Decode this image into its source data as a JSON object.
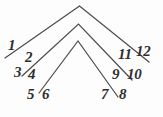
{
  "figure": {
    "background_color": "#fdfdfd",
    "ink_color": "#4a4a4a",
    "label_color": "#2e2e2e",
    "stroke_width": 1.2,
    "canvas": {
      "width": 163,
      "height": 117
    }
  },
  "chart_data": {
    "type": "diagram",
    "subtype": "nested-chevrons",
    "title": "",
    "xlabel": "",
    "ylabel": "",
    "grid": false,
    "legend": null,
    "axis_ranges": {
      "x": [
        0,
        163
      ],
      "y": [
        0,
        117
      ]
    },
    "shapes": [
      {
        "name": "outer-chevron",
        "apex": {
          "x": 79.5,
          "y": 6
        },
        "left_end": {
          "x": 5,
          "y": 58
        },
        "right_end": {
          "x": 149,
          "y": 62
        },
        "points": "5,58 79.5,6 149,62"
      },
      {
        "name": "middle-chevron",
        "apex": {
          "x": 78.5,
          "y": 24
        },
        "left_end": {
          "x": 22,
          "y": 76
        },
        "right_end": {
          "x": 132,
          "y": 80
        },
        "points": "22,76 78.5,24 132,80"
      },
      {
        "name": "inner-chevron",
        "apex": {
          "x": 78,
          "y": 41
        },
        "left_end": {
          "x": 39,
          "y": 93
        },
        "right_end": {
          "x": 118,
          "y": 97
        },
        "points": "39,93 78,41 118,97"
      }
    ],
    "labels": [
      {
        "id": 1,
        "text": "1",
        "side": "left",
        "x": 8,
        "y": 38,
        "font_size": 15
      },
      {
        "id": 2,
        "text": "2",
        "side": "left",
        "x": 25,
        "y": 50,
        "font_size": 15
      },
      {
        "id": 3,
        "text": "3",
        "side": "left",
        "x": 14,
        "y": 65,
        "font_size": 15
      },
      {
        "id": 4,
        "text": "4",
        "side": "left",
        "x": 28,
        "y": 67,
        "font_size": 15
      },
      {
        "id": 5,
        "text": "5",
        "side": "left",
        "x": 27,
        "y": 87,
        "font_size": 15
      },
      {
        "id": 6,
        "text": "6",
        "side": "left",
        "x": 42,
        "y": 87,
        "font_size": 15
      },
      {
        "id": 7,
        "text": "7",
        "side": "right",
        "x": 101,
        "y": 87,
        "font_size": 15
      },
      {
        "id": 8,
        "text": "8",
        "side": "right",
        "x": 119,
        "y": 87,
        "font_size": 15
      },
      {
        "id": 9,
        "text": "9",
        "side": "right",
        "x": 112,
        "y": 67,
        "font_size": 15
      },
      {
        "id": 10,
        "text": "10",
        "side": "right",
        "x": 127,
        "y": 67,
        "font_size": 15
      },
      {
        "id": 11,
        "text": "11",
        "side": "right",
        "x": 118,
        "y": 47,
        "font_size": 15
      },
      {
        "id": 12,
        "text": "12",
        "side": "right",
        "x": 136,
        "y": 44,
        "font_size": 15
      }
    ]
  }
}
